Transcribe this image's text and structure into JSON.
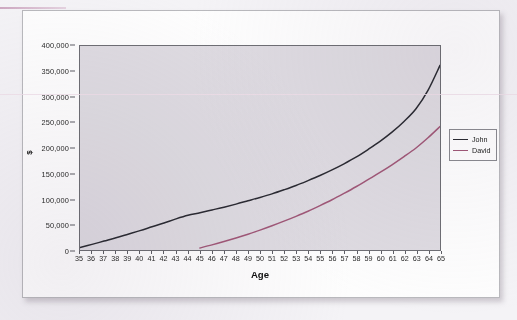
{
  "chart_data": {
    "type": "line",
    "title": "",
    "xlabel": "Age",
    "ylabel": "$",
    "xlim": [
      35,
      65
    ],
    "ylim": [
      0,
      400000
    ],
    "ytick_step": 50000,
    "grid": false,
    "legend_position": "right",
    "plot_background": "#dedbe1",
    "categories": [
      35,
      36,
      37,
      38,
      39,
      40,
      41,
      42,
      43,
      44,
      45,
      46,
      47,
      48,
      49,
      50,
      51,
      52,
      53,
      54,
      55,
      56,
      57,
      58,
      59,
      60,
      61,
      62,
      63,
      64,
      65
    ],
    "xtick_labels": [
      "35",
      "36",
      "37",
      "38",
      "39",
      "40",
      "41",
      "42",
      "43",
      "44",
      "45",
      "46",
      "47",
      "48",
      "49",
      "50",
      "51",
      "52",
      "53",
      "54",
      "55",
      "56",
      "57",
      "58",
      "59",
      "60",
      "61",
      "62",
      "63",
      "64",
      "65"
    ],
    "ytick_labels": [
      "0",
      "50,000",
      "100,000",
      "150,000",
      "200,000",
      "250,000",
      "300,000",
      "350,000",
      "400,000"
    ],
    "ytick_values": [
      0,
      50000,
      100000,
      150000,
      200000,
      250000,
      300000,
      350000,
      400000
    ],
    "series": [
      {
        "name": "John",
        "color": "#2b2b33",
        "x": [
          35,
          36,
          37,
          38,
          39,
          40,
          41,
          42,
          43,
          44,
          45,
          46,
          47,
          48,
          49,
          50,
          51,
          52,
          53,
          54,
          55,
          56,
          57,
          58,
          59,
          60,
          61,
          62,
          63,
          64,
          65
        ],
        "values": [
          5000,
          11000,
          17500,
          24000,
          31000,
          38000,
          45500,
          53000,
          61000,
          68000,
          73000,
          78500,
          84000,
          90000,
          96500,
          103000,
          110000,
          118000,
          126500,
          136000,
          146000,
          157000,
          169000,
          182000,
          197000,
          213000,
          231000,
          252000,
          277000,
          313000,
          362000
        ]
      },
      {
        "name": "David",
        "color": "#a05878",
        "x": [
          45,
          46,
          47,
          48,
          49,
          50,
          51,
          52,
          53,
          54,
          55,
          56,
          57,
          58,
          59,
          60,
          61,
          62,
          63,
          64,
          65
        ],
        "values": [
          4000,
          10000,
          16500,
          23500,
          31000,
          39000,
          47500,
          56500,
          66000,
          76000,
          87000,
          98500,
          111000,
          124000,
          138000,
          152000,
          167000,
          183000,
          200000,
          220000,
          242000
        ]
      }
    ]
  },
  "legend": {
    "items": [
      {
        "label": "John",
        "color": "#2b2b33"
      },
      {
        "label": "David",
        "color": "#a05878"
      }
    ]
  },
  "axes": {
    "x_title": "Age",
    "y_title": "$"
  }
}
